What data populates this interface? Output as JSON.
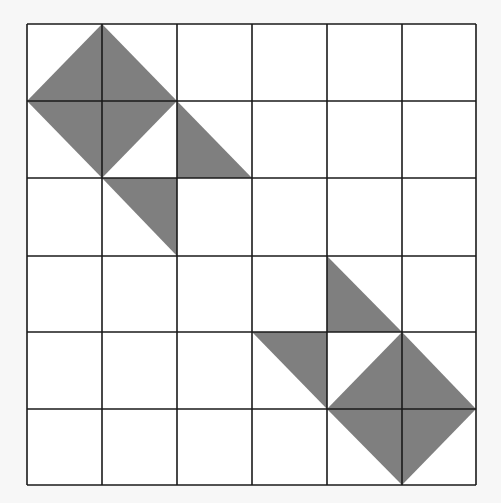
{
  "grid": {
    "columns": 6,
    "rows": 6,
    "x_lines": [
      27,
      102,
      177,
      252,
      327,
      402,
      476
    ],
    "y_lines": [
      24,
      101,
      178,
      256,
      332,
      409,
      485
    ],
    "line_color": "#1a1a1a",
    "background": "#ffffff"
  },
  "shapes": [
    {
      "type": "diamond",
      "vertices": [
        [
          1,
          0
        ],
        [
          2,
          1
        ],
        [
          1,
          2
        ],
        [
          0,
          1
        ]
      ]
    },
    {
      "type": "triangle",
      "vertices": [
        [
          2,
          1
        ],
        [
          2,
          2
        ],
        [
          3,
          2
        ]
      ]
    },
    {
      "type": "triangle",
      "vertices": [
        [
          1,
          2
        ],
        [
          2,
          2
        ],
        [
          2,
          3
        ]
      ]
    },
    {
      "type": "triangle",
      "vertices": [
        [
          4,
          3
        ],
        [
          4,
          4
        ],
        [
          5,
          4
        ]
      ]
    },
    {
      "type": "triangle",
      "vertices": [
        [
          3,
          4
        ],
        [
          4,
          4
        ],
        [
          4,
          5
        ]
      ]
    },
    {
      "type": "diamond",
      "vertices": [
        [
          5,
          4
        ],
        [
          6,
          5
        ],
        [
          5,
          6
        ],
        [
          4,
          5
        ]
      ]
    }
  ],
  "fill_color": "#7f7f7f"
}
